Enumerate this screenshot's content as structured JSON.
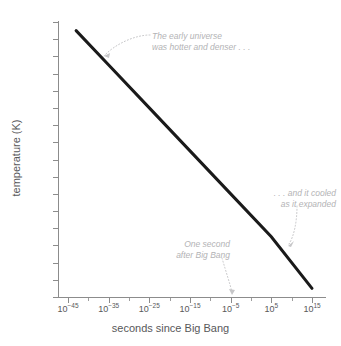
{
  "chart_data": {
    "type": "line",
    "title": "",
    "xlabel": "seconds since Big Bang",
    "ylabel": "temperature (K)",
    "xscale": "log",
    "yscale": "log",
    "xlim": [
      1e-48,
      1e+18
    ],
    "ylim": [
      1,
      1e+33
    ],
    "grid": false,
    "legend": null,
    "x_tick_labels": [
      "10−45",
      "10−35",
      "10−25",
      "10−15",
      "10−5",
      "10¹5",
      "10¹15"
    ],
    "x_tick_mantissa": "10",
    "x_tick_exponents": [
      "-45",
      "-35",
      "-25",
      "-15",
      "-5",
      "5",
      "15"
    ],
    "y_tick_mantissa": "10",
    "y_tick_exponents": [
      "32",
      "30",
      "28",
      "26",
      "24",
      "22",
      "20",
      "18",
      "16",
      "14",
      "12",
      "10",
      "8",
      "6",
      "4",
      "2"
    ],
    "y_tick_last_label": "1",
    "series": [
      {
        "name": "temperature vs time",
        "color": "#1a1a1a",
        "line_width_px": 3,
        "x": [
          1e-43,
          1e-35,
          1e-25,
          1e-15,
          1e-05,
          100000.0,
          1000000000000000.0
        ],
        "y": [
          1e+31,
          1e+27,
          1e+22,
          1e+17,
          1000000000000.0,
          10000000.0,
          10
        ]
      }
    ],
    "annotations": [
      {
        "id": "early-universe",
        "lines": [
          "The early universe",
          "was hotter and denser . . ."
        ],
        "points_to_x": 1e-38,
        "points_to_y": 1e+28,
        "color": "#b3b3b5"
      },
      {
        "id": "cooled",
        "lines": [
          ". . . and it cooled",
          "as it expanded"
        ],
        "points_to_x": 1000000000.0,
        "points_to_y": 100000.0,
        "color": "#b3b3b5"
      },
      {
        "id": "one-second",
        "lines": [
          "One second",
          "after Big Bang"
        ],
        "points_to_x": 1,
        "points_to_y": 1,
        "color": "#b3b3b5"
      }
    ],
    "axis_color": "#8c8c8c",
    "text_color": "#58585a"
  },
  "axes": {
    "x_title": "seconds since Big Bang",
    "y_title": "temperature (K)"
  },
  "y_ticks": [
    {
      "mantissa": "10",
      "exponent": "32"
    },
    {
      "mantissa": "10",
      "exponent": "30"
    },
    {
      "mantissa": "10",
      "exponent": "28"
    },
    {
      "mantissa": "10",
      "exponent": "26"
    },
    {
      "mantissa": "10",
      "exponent": "24"
    },
    {
      "mantissa": "10",
      "exponent": "22"
    },
    {
      "mantissa": "10",
      "exponent": "20"
    },
    {
      "mantissa": "10",
      "exponent": "18"
    },
    {
      "mantissa": "10",
      "exponent": "16"
    },
    {
      "mantissa": "10",
      "exponent": "14"
    },
    {
      "mantissa": "10",
      "exponent": "12"
    },
    {
      "mantissa": "10",
      "exponent": "10"
    },
    {
      "mantissa": "10",
      "exponent": "8"
    },
    {
      "mantissa": "10",
      "exponent": "6"
    },
    {
      "mantissa": "10",
      "exponent": "4"
    },
    {
      "mantissa": "10",
      "exponent": "2"
    },
    {
      "mantissa": "1",
      "exponent": ""
    }
  ],
  "x_ticks": [
    {
      "mantissa": "10",
      "exponent": "−45"
    },
    {
      "mantissa": "10",
      "exponent": "−35"
    },
    {
      "mantissa": "10",
      "exponent": "−25"
    },
    {
      "mantissa": "10",
      "exponent": "−15"
    },
    {
      "mantissa": "10",
      "exponent": "−5"
    },
    {
      "mantissa": "10",
      "exponent": "5"
    },
    {
      "mantissa": "10",
      "exponent": "15"
    }
  ],
  "annotations": {
    "early_universe": {
      "line1": "The early universe",
      "line2": "was hotter and denser . . ."
    },
    "cooled": {
      "line1": ". . . and it cooled",
      "line2": "as it expanded"
    },
    "one_second": {
      "line1": "One second",
      "line2": "after Big Bang"
    }
  }
}
